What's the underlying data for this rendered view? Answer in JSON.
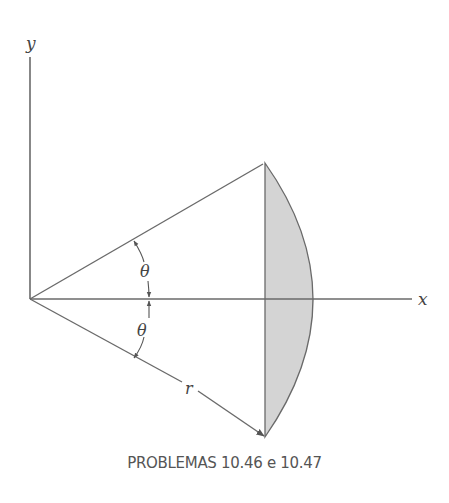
{
  "diagram": {
    "axes": {
      "x_label": "x",
      "y_label": "y"
    },
    "labels": {
      "theta_upper": "θ",
      "theta_lower": "θ",
      "radius": "r"
    },
    "region": {
      "description": "Circular segment bounded by the vertical chord and the arc of radius r, symmetric about the x-axis",
      "fill_color": "#d4d4d4",
      "stroke_color": "#666666"
    },
    "caption": "PROBLEMAS 10.46 e 10.47"
  }
}
